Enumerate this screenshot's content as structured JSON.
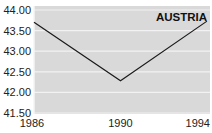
{
  "chart_data": {
    "type": "line",
    "title": "AUSTRIA",
    "xlabel": "",
    "ylabel": "",
    "categories": [
      "1986",
      "1990",
      "1994"
    ],
    "x": [
      1986,
      1990,
      1994
    ],
    "series": [
      {
        "name": "AUSTRIA",
        "values": [
          43.7,
          42.28,
          43.73
        ]
      }
    ],
    "ylim": [
      41.5,
      44.0
    ],
    "yticks": [
      "44.00",
      "43.50",
      "43.00",
      "42.50",
      "42.00",
      "41.50"
    ],
    "xticks": [
      "1986",
      "1990",
      "1994"
    ],
    "grid": true,
    "legend": "none",
    "colors": {
      "plot_bg": "#d9d9d9",
      "grid": "#f2f2f2",
      "line": "#1a1a1a"
    }
  }
}
